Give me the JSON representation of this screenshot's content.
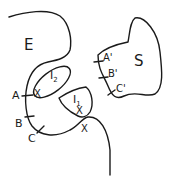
{
  "diagram": {
    "stroke_color": "#1a1a1a",
    "background": "#ffffff",
    "regions": {
      "E": {
        "label": "E"
      },
      "S": {
        "label": "S"
      },
      "I2": {
        "label": "I",
        "subscript": "2"
      },
      "I1": {
        "label": "I",
        "subscript": "1"
      }
    },
    "points_E": {
      "A": "A",
      "B": "B",
      "C": "C"
    },
    "points_S": {
      "A": "A'",
      "B": "B'",
      "C": "C'"
    },
    "marks": {
      "x1": "X",
      "x2": "X",
      "x3": "X"
    }
  }
}
